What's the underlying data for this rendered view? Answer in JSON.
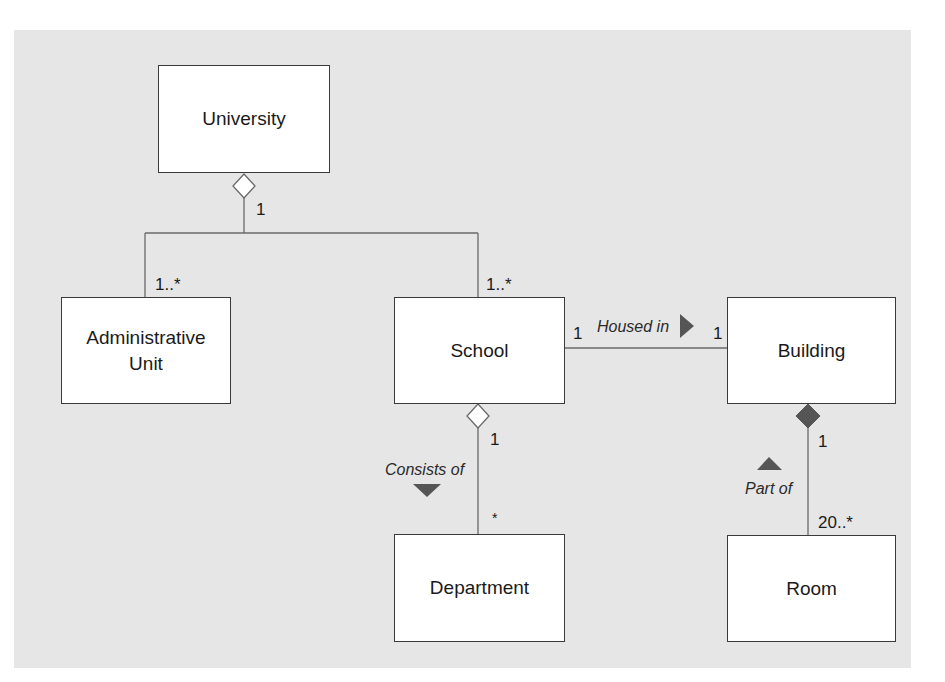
{
  "diagram": {
    "type": "UML class diagram",
    "colors": {
      "background": "#e6e6e6",
      "box_fill": "#ffffff",
      "line": "#6a6a6a",
      "arrow": "#555555"
    },
    "classes": {
      "university": "University",
      "admin_unit_line1": "Administrative",
      "admin_unit_line2": "Unit",
      "school": "School",
      "building": "Building",
      "department": "Department",
      "room": "Room"
    },
    "associations": {
      "university_parts": {
        "kind": "aggregation",
        "whole": "University",
        "whole_multiplicity": "1",
        "admin_multiplicity": "1..*",
        "school_multiplicity": "1..*"
      },
      "housed_in": {
        "kind": "association",
        "label": "Housed in",
        "direction_icon": "arrow-right",
        "school_multiplicity": "1",
        "building_multiplicity": "1"
      },
      "consists_of": {
        "kind": "aggregation",
        "label": "Consists of",
        "direction_icon": "arrow-down",
        "school_multiplicity": "1",
        "department_multiplicity": "*"
      },
      "part_of": {
        "kind": "composition",
        "label": "Part of",
        "direction_icon": "arrow-up",
        "building_multiplicity": "1",
        "room_multiplicity": "20..*"
      }
    }
  }
}
